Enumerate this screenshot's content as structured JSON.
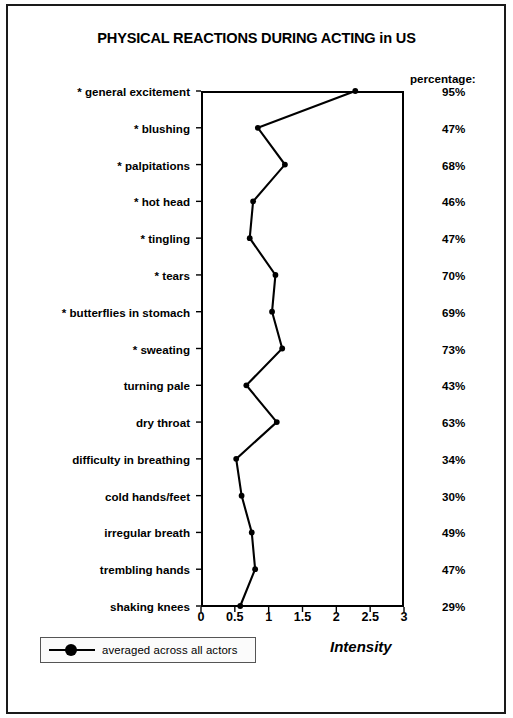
{
  "chart_data": {
    "type": "line",
    "title": "PHYSICAL REACTIONS DURING ACTING in US",
    "xlabel": "Intensity",
    "ylabel": "",
    "orientation": "horizontal",
    "xlim": [
      0,
      3
    ],
    "xticks": [
      0,
      0.5,
      1,
      1.5,
      2,
      2.5,
      3
    ],
    "xtick_labels": [
      "0",
      "0.5",
      "1",
      "1.5",
      "2",
      "2.5",
      "3"
    ],
    "grid": false,
    "legend_position": "bottom-left",
    "legend": [
      "averaged across all actors"
    ],
    "series": [
      {
        "name": "averaged across all actors",
        "values": [
          2.28,
          0.84,
          1.24,
          0.77,
          0.72,
          1.1,
          1.05,
          1.2,
          0.67,
          1.12,
          0.52,
          0.6,
          0.75,
          0.8,
          0.58
        ]
      }
    ],
    "categories": [
      "* general excitement",
      "* blushing",
      "* palpitations",
      "* hot head",
      "* tingling",
      "* tears",
      "* butterflies in stomach",
      "* sweating",
      "turning pale",
      "dry throat",
      "difficulty in breathing",
      "cold hands/feet",
      "irregular breath",
      "trembling hands",
      "shaking knees"
    ],
    "percentage_header": "percentage:",
    "percentages": [
      "95%",
      "47%",
      "68%",
      "46%",
      "47%",
      "70%",
      "69%",
      "73%",
      "43%",
      "63%",
      "34%",
      "30%",
      "49%",
      "47%",
      "29%"
    ],
    "colors": {
      "line": "#000000",
      "marker": "#000000",
      "axis": "#000000",
      "background": "#ffffff"
    }
  }
}
